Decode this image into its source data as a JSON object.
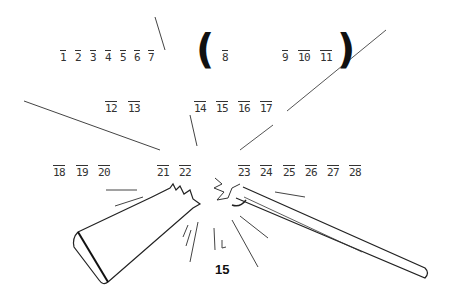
{
  "puzzle": {
    "row1": [
      "1",
      "2",
      "3",
      "4",
      "5",
      "6",
      "7"
    ],
    "paren_group": [
      "8",
      "9",
      "10",
      "11"
    ],
    "row2a": [
      "12",
      "13"
    ],
    "row2b": [
      "14",
      "15",
      "16",
      "17"
    ],
    "row3a": [
      "18",
      "19",
      "20"
    ],
    "row3b": [
      "21",
      "22"
    ],
    "row3c": [
      "23",
      "24",
      "25",
      "26",
      "27",
      "28"
    ],
    "open_paren": "(",
    "close_paren": ")"
  },
  "illustration": "broken-rifle",
  "page_number": "15"
}
